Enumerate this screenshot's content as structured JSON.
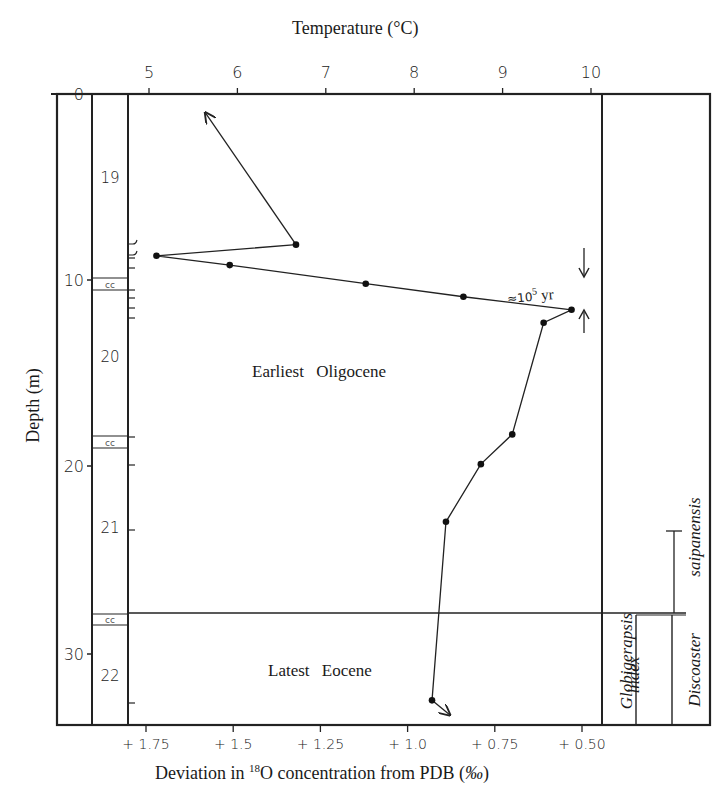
{
  "chart_data": {
    "type": "line",
    "title": "Temperature (°C)",
    "top_axis": {
      "label": "Temperature (°C)",
      "ticks": [
        5,
        6,
        7,
        8,
        9,
        10
      ],
      "tick_labels": [
        "5",
        "6",
        "7",
        "8",
        "9",
        "10"
      ]
    },
    "bottom_axis": {
      "label_parts": [
        "Deviation in ",
        "18",
        "O concentration from PDB (",
        "‰",
        ")"
      ],
      "label": "Deviation in 18O concentration from PDB (‰)",
      "ticks": [
        1.75,
        1.5,
        1.25,
        1.0,
        0.75,
        0.5
      ],
      "tick_labels": [
        "+ 1.75",
        "+ 1.5",
        "+ 1.25",
        "+ 1.0",
        "+ 0.75",
        "+ 0.50"
      ],
      "reversed": true
    },
    "left_axis": {
      "label": "Depth (m)",
      "ticks": [
        0,
        10,
        20,
        30
      ],
      "tick_labels": [
        "0",
        "10",
        "20",
        "30"
      ],
      "inverted": true
    },
    "xlabel": "Deviation in 18O concentration from PDB (‰)",
    "ylabel": "Depth (m)",
    "series": [
      {
        "name": "δ18O / temperature profile",
        "points": [
          {
            "depth": 8.1,
            "d18O": 1.32,
            "temperature": 6.7
          },
          {
            "depth": 8.7,
            "d18O": 1.72,
            "temperature": 5.1
          },
          {
            "depth": 9.2,
            "d18O": 1.51,
            "temperature": 5.9
          },
          {
            "depth": 10.2,
            "d18O": 1.12,
            "temperature": 7.4
          },
          {
            "depth": 10.9,
            "d18O": 0.84,
            "temperature": 8.6
          },
          {
            "depth": 11.6,
            "d18O": 0.53,
            "temperature": 9.8
          },
          {
            "depth": 12.3,
            "d18O": 0.61,
            "temperature": 9.5
          },
          {
            "depth": 18.3,
            "d18O": 0.7,
            "temperature": 9.1
          },
          {
            "depth": 19.9,
            "d18O": 0.79,
            "temperature": 8.8
          },
          {
            "depth": 23.0,
            "d18O": 0.89,
            "temperature": 8.4
          },
          {
            "depth": 32.6,
            "d18O": 0.93,
            "temperature": 8.2
          }
        ],
        "arrow_up_to": {
          "depth": 1.0,
          "d18O": 1.58,
          "temperature": 5.6
        },
        "arrow_down_to": {
          "depth": 33.5,
          "d18O": 0.89,
          "temperature": 8.4
        }
      }
    ],
    "core_sections": [
      {
        "label": "19",
        "depth_top": 0,
        "depth_bottom": 9.5
      },
      {
        "label": "20",
        "depth_top": 9.5,
        "depth_bottom": 19.0
      },
      {
        "label": "21",
        "depth_top": 19.0,
        "depth_bottom": 28.5
      },
      {
        "label": "22",
        "depth_top": 28.5,
        "depth_bottom": 34.0
      }
    ],
    "core_catcher_symbol": "cc",
    "annotations": [
      {
        "text": "Earliest Oligocene",
        "region": "above boundary"
      },
      {
        "text": "Latest Eocene",
        "region": "below boundary"
      },
      {
        "text": "≈10",
        "sup": "5",
        "suffix": " yr",
        "note": "time span of the rapid isotopic shift"
      }
    ],
    "boundary_depth": 28.2,
    "biozones": [
      {
        "label": "Globigerapsis",
        "italic": true
      },
      {
        "label": "index",
        "italic": true
      },
      {
        "label": "Discoaster",
        "italic": true
      },
      {
        "label": "saipanensis",
        "italic": true
      }
    ],
    "ylim": [
      0,
      34
    ],
    "xlim_d18O": [
      1.85,
      0.45
    ],
    "grid": false,
    "legend": "none"
  }
}
